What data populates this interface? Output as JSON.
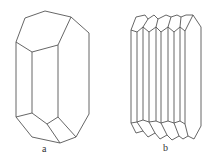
{
  "figure": {
    "crystals": [
      {
        "id": "a",
        "label": "a",
        "description": "single prismatic crystal with pinacoid terminations"
      },
      {
        "id": "b",
        "label": "b",
        "description": "polysynthetic twinned / stacked prismatic crystal"
      }
    ],
    "line_color": "#555555",
    "background": "#ffffff"
  }
}
